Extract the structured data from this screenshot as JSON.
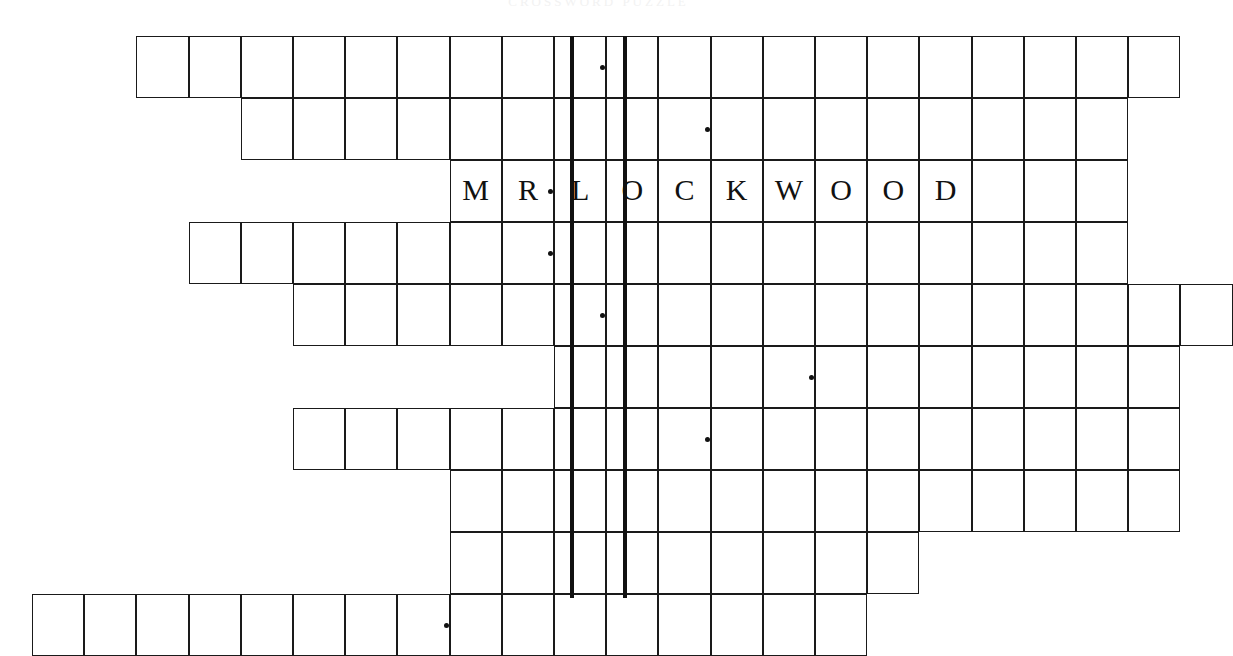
{
  "page": {
    "header_faint_text": "CROSSWORD PUZZLE",
    "background_color": "#ffffff",
    "ink_color": "#111111",
    "cell_border_color": "#1a1a1a"
  },
  "grid": {
    "origin_x": 32,
    "origin_y": 36,
    "cell_width": 52.2,
    "cell_height": 62.0,
    "rows_count": 10,
    "columns_span": 23,
    "thick_rule_color": "#111111",
    "thick_rule_width": 4
  },
  "thick_rules": [
    {
      "name": "left-keyword-rule",
      "x": 570,
      "y": 36,
      "height": 562
    },
    {
      "name": "right-keyword-rule",
      "x": 623,
      "y": 36,
      "height": 562
    }
  ],
  "answer_shown": {
    "row_index": 2,
    "text": "MR. LOCKWOOD",
    "letters": [
      "M",
      "R",
      "L",
      "O",
      "C",
      "K",
      "W",
      "O",
      "O",
      "D"
    ]
  },
  "rows": [
    {
      "index": 0,
      "name": "puzzle-row-1",
      "start_col": 2,
      "end_col": 21,
      "cells": [
        {
          "col": 2,
          "letter": "",
          "dot": false
        },
        {
          "col": 3,
          "letter": "",
          "dot": false
        },
        {
          "col": 4,
          "letter": "",
          "dot": false
        },
        {
          "col": 5,
          "letter": "",
          "dot": false
        },
        {
          "col": 6,
          "letter": "",
          "dot": false
        },
        {
          "col": 7,
          "letter": "",
          "dot": false
        },
        {
          "col": 8,
          "letter": "",
          "dot": false
        },
        {
          "col": 9,
          "letter": "",
          "dot": false
        },
        {
          "col": 10,
          "letter": "",
          "dot": true
        },
        {
          "col": 11,
          "letter": "",
          "dot": false
        },
        {
          "col": 12,
          "letter": "",
          "dot": false
        },
        {
          "col": 13,
          "letter": "",
          "dot": false
        },
        {
          "col": 14,
          "letter": "",
          "dot": false
        },
        {
          "col": 15,
          "letter": "",
          "dot": false
        },
        {
          "col": 16,
          "letter": "",
          "dot": false
        },
        {
          "col": 17,
          "letter": "",
          "dot": false
        },
        {
          "col": 18,
          "letter": "",
          "dot": false
        },
        {
          "col": 19,
          "letter": "",
          "dot": false
        },
        {
          "col": 20,
          "letter": "",
          "dot": false
        },
        {
          "col": 21,
          "letter": "",
          "dot": false
        }
      ]
    },
    {
      "index": 1,
      "name": "puzzle-row-2",
      "start_col": 4,
      "end_col": 20,
      "cells": [
        {
          "col": 4,
          "letter": "",
          "dot": false
        },
        {
          "col": 5,
          "letter": "",
          "dot": false
        },
        {
          "col": 6,
          "letter": "",
          "dot": false
        },
        {
          "col": 7,
          "letter": "",
          "dot": false
        },
        {
          "col": 8,
          "letter": "",
          "dot": false
        },
        {
          "col": 9,
          "letter": "",
          "dot": false
        },
        {
          "col": 10,
          "letter": "",
          "dot": false
        },
        {
          "col": 11,
          "letter": "",
          "dot": false
        },
        {
          "col": 12,
          "letter": "",
          "dot": true
        },
        {
          "col": 13,
          "letter": "",
          "dot": false
        },
        {
          "col": 14,
          "letter": "",
          "dot": false
        },
        {
          "col": 15,
          "letter": "",
          "dot": false
        },
        {
          "col": 16,
          "letter": "",
          "dot": false
        },
        {
          "col": 17,
          "letter": "",
          "dot": false
        },
        {
          "col": 18,
          "letter": "",
          "dot": false
        },
        {
          "col": 19,
          "letter": "",
          "dot": false
        },
        {
          "col": 20,
          "letter": "",
          "dot": false
        }
      ]
    },
    {
      "index": 2,
      "name": "puzzle-row-3-answer",
      "start_col": 8,
      "end_col": 20,
      "cells": [
        {
          "col": 8,
          "letter": "M",
          "dot": false
        },
        {
          "col": 9,
          "letter": "R",
          "dot": true
        },
        {
          "col": 10,
          "letter": "L",
          "dot": false
        },
        {
          "col": 11,
          "letter": "O",
          "dot": false
        },
        {
          "col": 12,
          "letter": "C",
          "dot": false
        },
        {
          "col": 13,
          "letter": "K",
          "dot": false
        },
        {
          "col": 14,
          "letter": "W",
          "dot": false
        },
        {
          "col": 15,
          "letter": "O",
          "dot": false
        },
        {
          "col": 16,
          "letter": "O",
          "dot": false
        },
        {
          "col": 17,
          "letter": "D",
          "dot": false
        },
        {
          "col": 18,
          "letter": "",
          "dot": false
        },
        {
          "col": 19,
          "letter": "",
          "dot": false
        },
        {
          "col": 20,
          "letter": "",
          "dot": false
        }
      ]
    },
    {
      "index": 3,
      "name": "puzzle-row-4",
      "start_col": 3,
      "end_col": 20,
      "cells": [
        {
          "col": 3,
          "letter": "",
          "dot": false
        },
        {
          "col": 4,
          "letter": "",
          "dot": false
        },
        {
          "col": 5,
          "letter": "",
          "dot": false
        },
        {
          "col": 6,
          "letter": "",
          "dot": false
        },
        {
          "col": 7,
          "letter": "",
          "dot": false
        },
        {
          "col": 8,
          "letter": "",
          "dot": false
        },
        {
          "col": 9,
          "letter": "",
          "dot": true
        },
        {
          "col": 10,
          "letter": "",
          "dot": false
        },
        {
          "col": 11,
          "letter": "",
          "dot": false
        },
        {
          "col": 12,
          "letter": "",
          "dot": false
        },
        {
          "col": 13,
          "letter": "",
          "dot": false
        },
        {
          "col": 14,
          "letter": "",
          "dot": false
        },
        {
          "col": 15,
          "letter": "",
          "dot": false
        },
        {
          "col": 16,
          "letter": "",
          "dot": false
        },
        {
          "col": 17,
          "letter": "",
          "dot": false
        },
        {
          "col": 18,
          "letter": "",
          "dot": false
        },
        {
          "col": 19,
          "letter": "",
          "dot": false
        },
        {
          "col": 20,
          "letter": "",
          "dot": false
        }
      ]
    },
    {
      "index": 4,
      "name": "puzzle-row-5",
      "start_col": 5,
      "end_col": 22,
      "cells": [
        {
          "col": 5,
          "letter": "",
          "dot": false
        },
        {
          "col": 6,
          "letter": "",
          "dot": false
        },
        {
          "col": 7,
          "letter": "",
          "dot": false
        },
        {
          "col": 8,
          "letter": "",
          "dot": false
        },
        {
          "col": 9,
          "letter": "",
          "dot": false
        },
        {
          "col": 10,
          "letter": "",
          "dot": true
        },
        {
          "col": 11,
          "letter": "",
          "dot": false
        },
        {
          "col": 12,
          "letter": "",
          "dot": false
        },
        {
          "col": 13,
          "letter": "",
          "dot": false
        },
        {
          "col": 14,
          "letter": "",
          "dot": false
        },
        {
          "col": 15,
          "letter": "",
          "dot": false
        },
        {
          "col": 16,
          "letter": "",
          "dot": false
        },
        {
          "col": 17,
          "letter": "",
          "dot": false
        },
        {
          "col": 18,
          "letter": "",
          "dot": false
        },
        {
          "col": 19,
          "letter": "",
          "dot": false
        },
        {
          "col": 20,
          "letter": "",
          "dot": false
        },
        {
          "col": 21,
          "letter": "",
          "dot": false
        },
        {
          "col": 22,
          "letter": "",
          "dot": false
        }
      ]
    },
    {
      "index": 5,
      "name": "puzzle-row-6",
      "start_col": 10,
      "end_col": 21,
      "cells": [
        {
          "col": 10,
          "letter": "",
          "dot": false
        },
        {
          "col": 11,
          "letter": "",
          "dot": false
        },
        {
          "col": 12,
          "letter": "",
          "dot": false
        },
        {
          "col": 13,
          "letter": "",
          "dot": false
        },
        {
          "col": 14,
          "letter": "",
          "dot": true
        },
        {
          "col": 15,
          "letter": "",
          "dot": false
        },
        {
          "col": 16,
          "letter": "",
          "dot": false
        },
        {
          "col": 17,
          "letter": "",
          "dot": false
        },
        {
          "col": 18,
          "letter": "",
          "dot": false
        },
        {
          "col": 19,
          "letter": "",
          "dot": false
        },
        {
          "col": 20,
          "letter": "",
          "dot": false
        },
        {
          "col": 21,
          "letter": "",
          "dot": false
        }
      ]
    },
    {
      "index": 6,
      "name": "puzzle-row-7",
      "start_col": 5,
      "end_col": 21,
      "cells": [
        {
          "col": 5,
          "letter": "",
          "dot": false
        },
        {
          "col": 6,
          "letter": "",
          "dot": false
        },
        {
          "col": 7,
          "letter": "",
          "dot": false
        },
        {
          "col": 8,
          "letter": "",
          "dot": false
        },
        {
          "col": 9,
          "letter": "",
          "dot": false
        },
        {
          "col": 10,
          "letter": "",
          "dot": false
        },
        {
          "col": 11,
          "letter": "",
          "dot": false
        },
        {
          "col": 12,
          "letter": "",
          "dot": true
        },
        {
          "col": 13,
          "letter": "",
          "dot": false
        },
        {
          "col": 14,
          "letter": "",
          "dot": false
        },
        {
          "col": 15,
          "letter": "",
          "dot": false
        },
        {
          "col": 16,
          "letter": "",
          "dot": false
        },
        {
          "col": 17,
          "letter": "",
          "dot": false
        },
        {
          "col": 18,
          "letter": "",
          "dot": false
        },
        {
          "col": 19,
          "letter": "",
          "dot": false
        },
        {
          "col": 20,
          "letter": "",
          "dot": false
        },
        {
          "col": 21,
          "letter": "",
          "dot": false
        }
      ]
    },
    {
      "index": 7,
      "name": "puzzle-row-8",
      "start_col": 8,
      "end_col": 21,
      "cells": [
        {
          "col": 8,
          "letter": "",
          "dot": false
        },
        {
          "col": 9,
          "letter": "",
          "dot": false
        },
        {
          "col": 10,
          "letter": "",
          "dot": false
        },
        {
          "col": 11,
          "letter": "",
          "dot": false
        },
        {
          "col": 12,
          "letter": "",
          "dot": false
        },
        {
          "col": 13,
          "letter": "",
          "dot": false
        },
        {
          "col": 14,
          "letter": "",
          "dot": false
        },
        {
          "col": 15,
          "letter": "",
          "dot": false
        },
        {
          "col": 16,
          "letter": "",
          "dot": false
        },
        {
          "col": 17,
          "letter": "",
          "dot": false
        },
        {
          "col": 18,
          "letter": "",
          "dot": false
        },
        {
          "col": 19,
          "letter": "",
          "dot": false
        },
        {
          "col": 20,
          "letter": "",
          "dot": false
        },
        {
          "col": 21,
          "letter": "",
          "dot": false
        }
      ]
    },
    {
      "index": 8,
      "name": "puzzle-row-9",
      "start_col": 8,
      "end_col": 16,
      "cells": [
        {
          "col": 8,
          "letter": "",
          "dot": false
        },
        {
          "col": 9,
          "letter": "",
          "dot": false
        },
        {
          "col": 10,
          "letter": "",
          "dot": false
        },
        {
          "col": 11,
          "letter": "",
          "dot": false
        },
        {
          "col": 12,
          "letter": "",
          "dot": false
        },
        {
          "col": 13,
          "letter": "",
          "dot": false
        },
        {
          "col": 14,
          "letter": "",
          "dot": false
        },
        {
          "col": 15,
          "letter": "",
          "dot": false
        },
        {
          "col": 16,
          "letter": "",
          "dot": false
        }
      ]
    },
    {
      "index": 9,
      "name": "puzzle-row-10",
      "start_col": 0,
      "end_col": 15,
      "cells": [
        {
          "col": 0,
          "letter": "",
          "dot": false
        },
        {
          "col": 1,
          "letter": "",
          "dot": false
        },
        {
          "col": 2,
          "letter": "",
          "dot": false
        },
        {
          "col": 3,
          "letter": "",
          "dot": false
        },
        {
          "col": 4,
          "letter": "",
          "dot": false
        },
        {
          "col": 5,
          "letter": "",
          "dot": false
        },
        {
          "col": 6,
          "letter": "",
          "dot": false
        },
        {
          "col": 7,
          "letter": "",
          "dot": true
        },
        {
          "col": 8,
          "letter": "",
          "dot": false
        },
        {
          "col": 9,
          "letter": "",
          "dot": false
        },
        {
          "col": 10,
          "letter": "",
          "dot": false
        },
        {
          "col": 11,
          "letter": "",
          "dot": false
        },
        {
          "col": 12,
          "letter": "",
          "dot": false
        },
        {
          "col": 13,
          "letter": "",
          "dot": false
        },
        {
          "col": 14,
          "letter": "",
          "dot": false
        },
        {
          "col": 15,
          "letter": "",
          "dot": false
        }
      ]
    }
  ]
}
